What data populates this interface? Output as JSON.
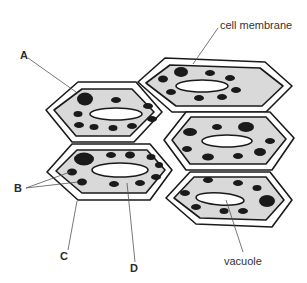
{
  "diagram": {
    "title": "",
    "labels": {
      "A": "A",
      "B": "B",
      "C": "C",
      "D": "D",
      "cell_membrane": "cell membrane",
      "vacuole": "vacuole"
    },
    "colors": {
      "cytoplasm": "#d9d9d9",
      "outline": "#1a1a1a",
      "granule": "#1a1a1a",
      "vacuole": "#ffffff",
      "leader_line": "#555555"
    },
    "cells": [
      {
        "id": "cell-top-left",
        "annotated": [
          "A"
        ]
      },
      {
        "id": "cell-top-right",
        "annotated": [
          "cell membrane"
        ]
      },
      {
        "id": "cell-middle-right",
        "annotated": []
      },
      {
        "id": "cell-middle-left",
        "annotated": [
          "B",
          "C",
          "D"
        ]
      },
      {
        "id": "cell-bottom-right",
        "annotated": [
          "vacuole"
        ]
      }
    ]
  }
}
